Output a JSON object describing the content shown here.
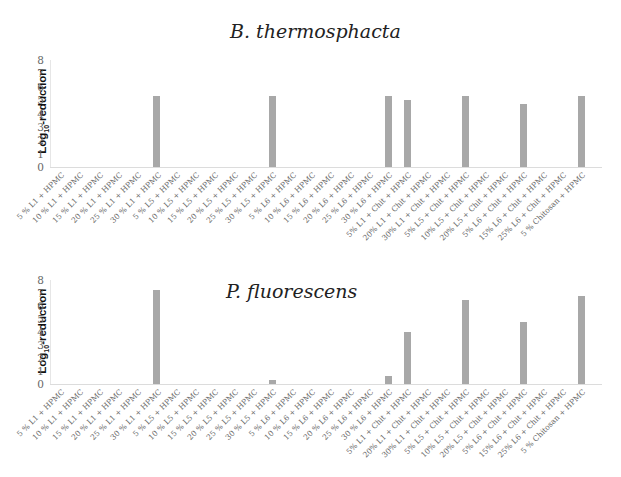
{
  "chart_data": [
    {
      "type": "bar",
      "title": "B. thermosphacta",
      "xlabel": "",
      "ylabel": "Log10-reduction",
      "ylim": [
        0,
        8
      ],
      "yticks": [
        0,
        1,
        2,
        3,
        4,
        5,
        6,
        7,
        8
      ],
      "grid": false,
      "legend": null,
      "bar_color": "#a8a8a8",
      "categories": [
        "5 % L1 + HPMC",
        "10 % L1 + HPMC",
        "15 % L1 + HPMC",
        "20 % L1 + HPMC",
        "25 % L1 + HPMC",
        "30 % L1 + HPMC",
        "5 % L5 + HPMC",
        "10 % L5 + HPMC",
        "15 % L5 + HPMC",
        "20 % L5 + HPMC",
        "25 % L5 + HPMC",
        "30 % L5 + HPMC",
        "5 % L6 + HPMC",
        "10 % L6 + HPMC",
        "15 % L6 + HPMC",
        "20 % L6 + HPMC",
        "25 % L6 + HPMC",
        "30 % L6 + HPMC",
        "5% L1 + Chit + HPMC",
        "20% L1 + Chit + HPMC",
        "30% L1 + Chit + HPMC",
        "5% L5 + Chit + HPMC",
        "10% L5 + Chit + HPMC",
        "20% L5 + Chit + HPMC",
        "5% L6 + Chit + HPMC",
        "15% L6 + Chit + HPMC",
        "25% L6 + Chit + HPMC",
        "5 % Chitosan + HPMC"
      ],
      "values": [
        0,
        0,
        0,
        0,
        0,
        5.3,
        0,
        0,
        0,
        0,
        0,
        5.3,
        0,
        0,
        0,
        0,
        0,
        5.3,
        5.0,
        0,
        0,
        5.3,
        0,
        0,
        4.7,
        0,
        0,
        5.3
      ]
    },
    {
      "type": "bar",
      "title": "P. fluorescens",
      "xlabel": "",
      "ylabel": "Log10-reduction",
      "ylim": [
        0,
        8
      ],
      "yticks": [
        0,
        1,
        2,
        3,
        4,
        5,
        6,
        7,
        8
      ],
      "grid": false,
      "legend": null,
      "bar_color": "#a8a8a8",
      "categories": [
        "5 % L1 + HPMC",
        "10 % L1 + HPMC",
        "15 % L1 + HPMC",
        "20 % L1 + HPMC",
        "25 % L1 + HPMC",
        "30 % L1 + HPMC",
        "5 % L5 + HPMC",
        "10 % L5 + HPMC",
        "15 % L5 + HPMC",
        "20 % L5 + HPMC",
        "25 % L5 + HPMC",
        "30 % L5 + HPMC",
        "5 % L6 + HPMC",
        "10 % L6 + HPMC",
        "15 % L6 + HPMC",
        "20 % L6 + HPMC",
        "25 % L6 + HPMC",
        "30 % L6 + HPMC",
        "5% L1 + Chit + HPMC",
        "20% L1 + Chit + HPMC",
        "30% L1 + Chit + HPMC",
        "5% L5 + Chit + HPMC",
        "10% L5 + Chit + HPMC",
        "20% L5 + Chit + HPMC",
        "5% L6 + Chit + HPMC",
        "15% L6 + Chit + HPMC",
        "25% L6 + Chit + HPMC",
        "5 % Chitosan + HPMC"
      ],
      "values": [
        0,
        0,
        0,
        0,
        0,
        7.2,
        0,
        0,
        0,
        0,
        0,
        0.3,
        0,
        0,
        0,
        0,
        0,
        0.6,
        4.0,
        0,
        0,
        6.5,
        0,
        0,
        4.8,
        0,
        0,
        6.8
      ]
    }
  ],
  "charts": [
    {
      "title": "B. thermosphacta",
      "ylabel_main": "Log",
      "ylabel_sub": "10",
      "ylabel_rest": "-reduction"
    },
    {
      "title": "P. fluorescens",
      "ylabel_main": "Log",
      "ylabel_sub": "10",
      "ylabel_rest": "-reduction"
    }
  ]
}
